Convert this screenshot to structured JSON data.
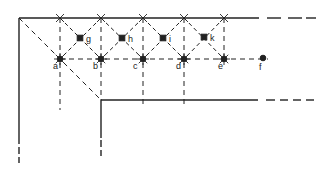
{
  "diagram": {
    "type": "lattice-corner-schematic",
    "colors": {
      "ink": "#222222",
      "background": "#ffffff"
    },
    "outer_boundary": {
      "corner": [
        19,
        18
      ],
      "top_solid_end_x": 259,
      "left_solid_end_y": 144,
      "top_dash_segments": [
        [
          267,
          281
        ],
        [
          288,
          302
        ],
        [
          306,
          316
        ]
      ],
      "left_dash_segments": [
        [
          147,
          154
        ],
        [
          157,
          163
        ]
      ]
    },
    "inner_boundary": {
      "corner": [
        101,
        100
      ],
      "top_solid_end_x": 258,
      "left_solid_end_y": 138,
      "top_dash_segments": [
        [
          266,
          275
        ],
        [
          280,
          288
        ],
        [
          293,
          301
        ],
        [
          306,
          314
        ]
      ],
      "left_dash_segments": [
        [
          140,
          147
        ],
        [
          150,
          156
        ]
      ]
    },
    "circle_points": [
      {
        "id": "a",
        "label": "a",
        "x": 60,
        "y": 59,
        "lx": 53,
        "ly": 69
      },
      {
        "id": "b",
        "label": "b",
        "x": 101,
        "y": 59,
        "lx": 93,
        "ly": 69
      },
      {
        "id": "c",
        "label": "c",
        "x": 143,
        "y": 59,
        "lx": 133,
        "ly": 69
      },
      {
        "id": "d",
        "label": "d",
        "x": 184,
        "y": 59,
        "lx": 176,
        "ly": 69
      },
      {
        "id": "e",
        "label": "e",
        "x": 224,
        "y": 59,
        "lx": 218,
        "ly": 69
      },
      {
        "id": "f",
        "label": "f",
        "x": 263,
        "y": 58,
        "lx": 259,
        "ly": 70
      }
    ],
    "square_points": [
      {
        "id": "g",
        "label": "g",
        "x": 80,
        "y": 38,
        "lx": 86,
        "ly": 42
      },
      {
        "id": "h",
        "label": "h",
        "x": 122,
        "y": 38,
        "lx": 128,
        "ly": 42
      },
      {
        "id": "i",
        "label": "i",
        "x": 163,
        "y": 38,
        "lx": 169,
        "ly": 42
      },
      {
        "id": "k",
        "label": "k",
        "x": 204,
        "y": 37,
        "lx": 210,
        "ly": 41
      }
    ],
    "top_crosses_x": [
      60,
      101,
      143,
      184,
      224
    ],
    "row_y": 59,
    "top_y": 18
  }
}
